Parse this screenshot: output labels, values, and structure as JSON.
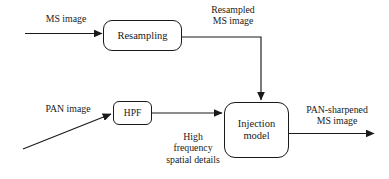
{
  "diagram": {
    "type": "flowchart",
    "background_color": "#ffffff",
    "stroke_color": "#1a1a1a",
    "nodes": [
      {
        "id": "resampling",
        "label": "Resampling"
      },
      {
        "id": "hpf",
        "label": "HPF"
      },
      {
        "id": "injection",
        "label": "Injection\nmodel"
      }
    ],
    "edge_labels": [
      {
        "id": "ms_image",
        "text": "MS image"
      },
      {
        "id": "resampled_ms_image",
        "text": "Resampled\nMS image"
      },
      {
        "id": "pan_image",
        "text": "PAN image"
      },
      {
        "id": "high_frequency",
        "text": "High\nfrequency\nspatial details"
      },
      {
        "id": "pan_sharpened",
        "text": "PAN-sharpened\nMS image"
      }
    ]
  }
}
